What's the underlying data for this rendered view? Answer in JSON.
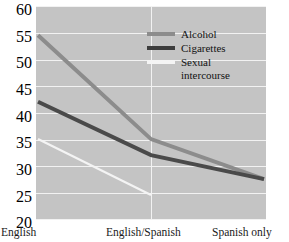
{
  "chart_data": {
    "type": "line",
    "title": "",
    "xlabel": "",
    "ylabel": "",
    "categories": [
      "English",
      "English/Spanish",
      "Spanish only"
    ],
    "ylim": [
      20,
      60
    ],
    "yticks": [
      20,
      25,
      30,
      35,
      40,
      45,
      50,
      55,
      60
    ],
    "grid": true,
    "legend_position": "inside-top-right",
    "series": [
      {
        "name": "Alcohol",
        "color": "#8c8c8c",
        "values": [
          54.5,
          35.0,
          27.5
        ]
      },
      {
        "name": "Cigarettes",
        "color": "#4a4a4a",
        "values": [
          42.0,
          32.0,
          27.5
        ]
      },
      {
        "name": "Sexual intercourse",
        "color": "#f4f4f4",
        "values": [
          35.0,
          24.5,
          null
        ]
      }
    ]
  },
  "axis": {
    "y_labels": [
      "60",
      "55",
      "50",
      "45",
      "40",
      "35",
      "30",
      "25",
      "20"
    ],
    "x_labels": [
      "English",
      "English/Spanish",
      "Spanish only"
    ]
  },
  "legend": {
    "items": [
      {
        "label": "Alcohol",
        "label_line1": "Alcohol",
        "label_line2": ""
      },
      {
        "label": "Cigarettes",
        "label_line1": "Cigarettes",
        "label_line2": ""
      },
      {
        "label": "Sexual intercourse",
        "label_line1": "Sexual",
        "label_line2": "intercourse"
      }
    ]
  },
  "colors": {
    "plot_background": "#c4c4c4",
    "gridline": "#f2f2f2",
    "alcohol": "#8c8c8c",
    "cigarettes": "#4a4a4a",
    "sexual_intercourse": "#f4f4f4",
    "page_background": "#ffffff",
    "text": "#1a1a1a"
  }
}
